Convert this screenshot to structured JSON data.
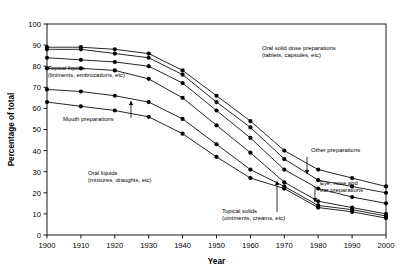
{
  "chart_data": {
    "type": "line",
    "title": "",
    "xlabel": "Year",
    "ylabel": "Percentage of total",
    "x": [
      1900,
      1910,
      1920,
      1930,
      1940,
      1950,
      1960,
      1970,
      1980,
      1990,
      2000
    ],
    "xlim": [
      1900,
      2000
    ],
    "ylim": [
      0,
      100
    ],
    "xticks": [
      "1900",
      "1910",
      "1920",
      "1930",
      "1940",
      "1950",
      "1960",
      "1970",
      "1980",
      "1990",
      "2000"
    ],
    "yticks": [
      "0",
      "10",
      "20",
      "30",
      "40",
      "50",
      "60",
      "70",
      "80",
      "90",
      "100"
    ],
    "grid": false,
    "legend": "annotations-inline",
    "marker": "filled-circle",
    "series": [
      {
        "name": "Oral solid dose preparations (tablets, capsules, etc)",
        "values": [
          89,
          89,
          88,
          86,
          78,
          66,
          54,
          40,
          31,
          27,
          23
        ]
      },
      {
        "name": "Other preparations",
        "values": [
          88,
          88,
          86,
          84,
          76,
          63,
          51,
          36,
          26,
          23,
          20
        ]
      },
      {
        "name": "Eye, nose and ear preparations",
        "values": [
          84,
          83,
          82,
          80,
          72,
          59,
          46,
          31,
          22,
          18,
          15
        ]
      },
      {
        "name": "Topical liquids (liniments, embrocations, etc)",
        "values": [
          79,
          79,
          78,
          74,
          65,
          52,
          39,
          25,
          16,
          13,
          10
        ]
      },
      {
        "name": "Mouth preparations",
        "values": [
          69,
          68,
          66,
          63,
          55,
          43,
          31,
          23,
          14,
          12,
          9
        ]
      },
      {
        "name": "Oral liquids (mixtures, draughts, etc)",
        "values": [
          63,
          61,
          59,
          56,
          48,
          37,
          27,
          22,
          13,
          11,
          8
        ]
      }
    ],
    "annotations": [
      {
        "id": "oral-solid-dose",
        "lines": [
          "Oral solid dose preparations",
          "(tablets, capsules, etc)"
        ],
        "x": 262,
        "y": 50,
        "anchor": "start",
        "arrow": false
      },
      {
        "id": "topical-liquids",
        "lines": [
          "Topical liquids",
          "(liniments, embrocations, etc)"
        ],
        "x": 48,
        "y": 70,
        "anchor": "start",
        "arrow": false
      },
      {
        "id": "mouth-preparations",
        "lines": [
          "Mouth preparations"
        ],
        "x": 63,
        "y": 121,
        "anchor": "start",
        "arrow": true
      },
      {
        "id": "oral-liquids",
        "lines": [
          "Oral liquids",
          "(mixtures, draughts, etc)"
        ],
        "x": 88,
        "y": 175,
        "anchor": "start",
        "arrow": false
      },
      {
        "id": "other-preparations",
        "lines": [
          "Other preparations"
        ],
        "x": 311,
        "y": 152,
        "anchor": "start",
        "arrow": true
      },
      {
        "id": "eye-nose-ear",
        "lines": [
          "Eye, nose and",
          "ear preparations"
        ],
        "x": 320,
        "y": 185,
        "anchor": "start",
        "arrow": true
      },
      {
        "id": "topical-solids",
        "lines": [
          "Topical solids",
          "(ointments, creams, etc)"
        ],
        "x": 222,
        "y": 213,
        "anchor": "start",
        "arrow": true
      }
    ]
  },
  "colors": {
    "line": "#000000",
    "marker": "#000000",
    "axis": "#000000",
    "background": "#ffffff"
  }
}
